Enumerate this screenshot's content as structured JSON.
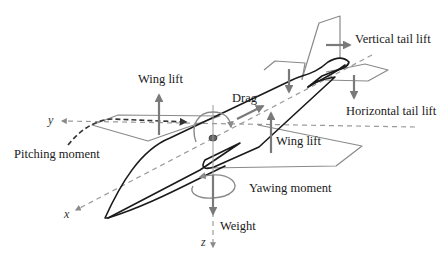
{
  "diagram": {
    "type": "aircraft-force-diagram",
    "labels": {
      "wing_lift_left": "Wing lift",
      "wing_lift_right": "Wing lift",
      "drag": "Drag",
      "vertical_tail_lift": "Vertical tail lift",
      "horizontal_tail_lift": "Horizontal tail lift",
      "pitching_moment": "Pitching moment",
      "yawing_moment": "Yawing moment",
      "weight": "Weight"
    },
    "axes": {
      "x": "x",
      "y": "y",
      "z": "z"
    },
    "colors": {
      "outline": "#1a1a1a",
      "surface": "#8a8a8a",
      "force_arrow": "#7a7a7a",
      "axis": "#9a9a9a",
      "background": "#ffffff"
    }
  }
}
